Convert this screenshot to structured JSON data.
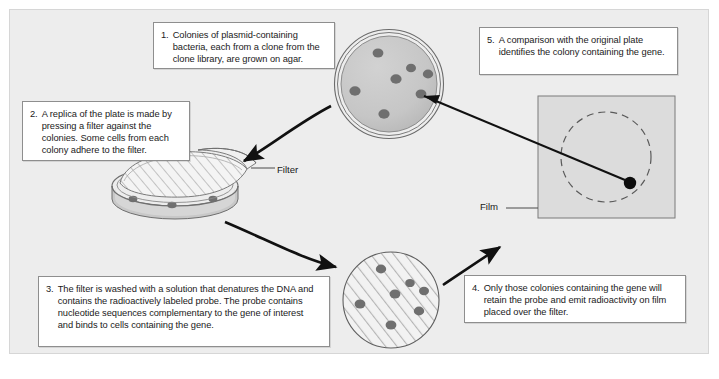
{
  "diagram": {
    "background_color": "#ededed",
    "frame_border_color": "#d6d6d6",
    "callout_border_color": "#8e8e8e",
    "colony_color": "#6f6f6f",
    "dish_fill_color": "#c9c9c9",
    "film_fill_color": "#dcdcdc",
    "arrow_color": "#111111"
  },
  "steps": [
    {
      "id": "step-1",
      "number": "1.",
      "text": "Colonies of plasmid-containing bacteria, each from a clone from the clone library, are grown on agar."
    },
    {
      "id": "step-2",
      "number": "2.",
      "text": "A replica of the plate is made by pressing a filter against the colonies. Some cells from each colony adhere to the filter."
    },
    {
      "id": "step-3",
      "number": "3.",
      "text": "The filter is washed with a solution that denatures the DNA and contains the radioactively labeled probe. The probe contains nucleotide sequences complementary to the gene of interest and binds to cells containing the gene."
    },
    {
      "id": "step-4",
      "number": "4.",
      "text": "Only those colonies containing the gene will retain the probe and emit radioactivity on film placed over the filter."
    },
    {
      "id": "step-5",
      "number": "5.",
      "text": "A comparison with the original plate identifies the colony containing the gene."
    }
  ],
  "labels": {
    "filter": "Filter",
    "film": "Film"
  },
  "figures": {
    "agar_plate": {
      "name": "agar-plate-with-colonies",
      "center": [
        389,
        84
      ],
      "radius": 54,
      "colony_count": 7,
      "colonies": [
        [
          378,
          53
        ],
        [
          411,
          68
        ],
        [
          428,
          74
        ],
        [
          396,
          79
        ],
        [
          355,
          91
        ],
        [
          421,
          94
        ],
        [
          384,
          114
        ]
      ]
    },
    "replica_dish": {
      "name": "replica-dish-with-filter",
      "center": [
        175,
        192
      ]
    },
    "probe_filter": {
      "name": "hatched-filter-with-colonies",
      "center": [
        391,
        300
      ],
      "radius": 48,
      "colony_count": 7,
      "colonies": [
        [
          381,
          269
        ],
        [
          410,
          283
        ],
        [
          424,
          291
        ],
        [
          395,
          294
        ],
        [
          360,
          304
        ],
        [
          419,
          311
        ],
        [
          391,
          325
        ]
      ]
    },
    "film": {
      "name": "autoradiography-film",
      "rect": [
        538,
        96,
        137,
        122
      ],
      "dashed_circle_center": [
        606,
        157
      ],
      "dashed_circle_radius": 45,
      "signal_spot": [
        630,
        183
      ],
      "signal_spot_radius": 6
    }
  }
}
